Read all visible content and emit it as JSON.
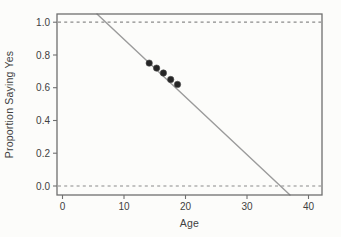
{
  "chart_data": {
    "type": "scatter",
    "title": "",
    "xlabel": "Age",
    "ylabel": "Proportion Saying Yes",
    "xlim": [
      -0.9,
      42.2
    ],
    "ylim": [
      -0.055,
      1.05
    ],
    "x_tick_values": [
      0,
      10,
      20,
      30,
      40
    ],
    "x_tick_labels": [
      "0",
      "10",
      "20",
      "30",
      "40"
    ],
    "y_tick_values": [
      0.0,
      0.2,
      0.4,
      0.6,
      0.8,
      1.0
    ],
    "y_tick_labels": [
      "0.0",
      "0.2",
      "0.4",
      "0.6",
      "0.8",
      "1.0"
    ],
    "points": [
      [
        14.1,
        0.75
      ],
      [
        15.3,
        0.72
      ],
      [
        16.4,
        0.69
      ],
      [
        17.6,
        0.65
      ],
      [
        18.7,
        0.62
      ]
    ],
    "regression_line": {
      "x": [
        5.6,
        37.0
      ],
      "y": [
        1.05,
        -0.055
      ]
    },
    "guide_lines": [
      1.0,
      0.0
    ],
    "grid": false,
    "legend_position": "none",
    "colors": {
      "background": "#fcfcfa",
      "frame": "#6f6f6f",
      "line": "#9b9b9b",
      "points": "#262626",
      "point_edge": "#4d4d4d",
      "guide": "#8a8a8a",
      "text": "#414141"
    }
  }
}
